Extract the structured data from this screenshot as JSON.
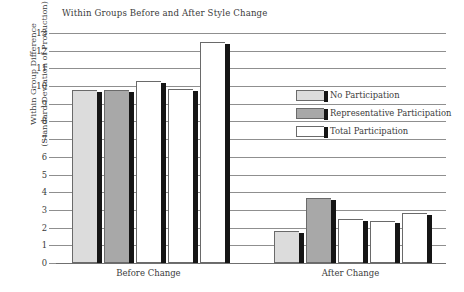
{
  "chart_data": {
    "type": "bar",
    "title": "Within Groups Before and After Style Change",
    "xlabel": "",
    "ylabel": "Within Group Difference (Standard Deviation of Production)",
    "ylabel_lines": [
      "Within Group Difference",
      "(Standard Deviation of Production)"
    ],
    "ylim": [
      0,
      13
    ],
    "ytick_labels": [
      "13",
      "12",
      "11",
      "10",
      "9",
      "8",
      "7",
      "6",
      "5",
      "4",
      "3",
      "2",
      "1",
      "0"
    ],
    "yticks": [
      13,
      12,
      11,
      10,
      9,
      8,
      7,
      6,
      5,
      4,
      3,
      2,
      1,
      0
    ],
    "grid": true,
    "legend_position": "right",
    "categories": [
      "Before Change",
      "After Change"
    ],
    "series": [
      {
        "name": "No Participation",
        "color": "#dcdcdc",
        "values": [
          9.75,
          1.8
        ]
      },
      {
        "name": "Representative Participation",
        "color": "#a8a8a8",
        "values": [
          9.75,
          3.65
        ]
      },
      {
        "name": "Total Participation",
        "color": "#ffffff",
        "values": [
          10.3,
          2.5
        ]
      },
      {
        "name": "Total Participation",
        "color": "#ffffff",
        "values": [
          9.85,
          2.35
        ]
      },
      {
        "name": "Total Participation",
        "color": "#ffffff",
        "values": [
          12.5,
          2.8
        ]
      }
    ],
    "bars": [
      {
        "group": "Before Change",
        "series": "No Participation",
        "value": 9.75,
        "color": "#dcdcdc"
      },
      {
        "group": "Before Change",
        "series": "Representative Participation",
        "value": 9.75,
        "color": "#a8a8a8"
      },
      {
        "group": "Before Change",
        "series": "Total Participation",
        "value": 10.3,
        "color": "#ffffff"
      },
      {
        "group": "Before Change",
        "series": "Total Participation",
        "value": 9.85,
        "color": "#ffffff"
      },
      {
        "group": "Before Change",
        "series": "Total Participation",
        "value": 12.5,
        "color": "#ffffff"
      },
      {
        "group": "After Change",
        "series": "No Participation",
        "value": 1.8,
        "color": "#dcdcdc"
      },
      {
        "group": "After Change",
        "series": "Representative Participation",
        "value": 3.65,
        "color": "#a8a8a8"
      },
      {
        "group": "After Change",
        "series": "Total Participation",
        "value": 2.5,
        "color": "#ffffff"
      },
      {
        "group": "After Change",
        "series": "Total Participation",
        "value": 2.35,
        "color": "#ffffff"
      },
      {
        "group": "After Change",
        "series": "Total Participation",
        "value": 2.8,
        "color": "#ffffff"
      }
    ]
  },
  "legend": {
    "items": [
      {
        "label": "No Participation",
        "color": "#dcdcdc"
      },
      {
        "label": "Representative Participation",
        "color": "#a8a8a8"
      },
      {
        "label": "Total Participation",
        "color": "#ffffff"
      }
    ]
  },
  "colors": {
    "no_participation": "#dcdcdc",
    "representative_participation": "#a8a8a8",
    "total_participation": "#ffffff",
    "bar_outline": "#6a6a6a",
    "bar_shadow": "#151515",
    "gridline": "#8f8f8f",
    "text": "#3b3b3b",
    "background": "#ffffff"
  }
}
